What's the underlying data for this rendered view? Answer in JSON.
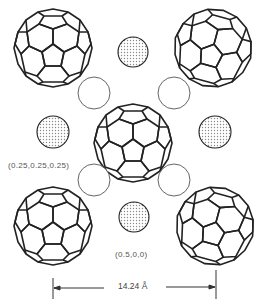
{
  "diagram": {
    "type": "crystal-structure",
    "fullerenes": [
      {
        "id": "top-left",
        "cx": 53,
        "cy": 48,
        "r": 40,
        "rot": 0
      },
      {
        "id": "top-right",
        "cx": 213,
        "cy": 48,
        "r": 40,
        "rot": 15
      },
      {
        "id": "center",
        "cx": 133,
        "cy": 143,
        "r": 40,
        "rot": 0
      },
      {
        "id": "bottom-left",
        "cx": 53,
        "cy": 226,
        "r": 40,
        "rot": 0
      },
      {
        "id": "bottom-right",
        "cx": 215,
        "cy": 226,
        "r": 40,
        "rot": 15
      }
    ],
    "octahedral_sites": [
      {
        "id": "top",
        "cx": 133,
        "cy": 52,
        "r": 15
      },
      {
        "id": "left",
        "cx": 53,
        "cy": 132,
        "r": 16
      },
      {
        "id": "right",
        "cx": 215,
        "cy": 132,
        "r": 16
      },
      {
        "id": "bottom",
        "cx": 134,
        "cy": 217,
        "r": 15
      }
    ],
    "tetrahedral_sites": [
      {
        "id": "upper-left",
        "cx": 94,
        "cy": 93,
        "r": 16
      },
      {
        "id": "upper-right",
        "cx": 174,
        "cy": 93,
        "r": 16
      },
      {
        "id": "lower-left",
        "cx": 94,
        "cy": 180,
        "r": 16
      },
      {
        "id": "lower-right",
        "cx": 174,
        "cy": 180,
        "r": 16
      }
    ],
    "labels": {
      "tetrahedral": "(0.25,0.25,0.25)",
      "octahedral": "(0.5,0,0)"
    },
    "dimension": {
      "value": "14.24 Å",
      "x1": 53,
      "x2": 216,
      "y": 288
    },
    "colors": {
      "stroke": "#222222",
      "shade": "#9a9a9a",
      "open_stroke": "#555555"
    }
  }
}
